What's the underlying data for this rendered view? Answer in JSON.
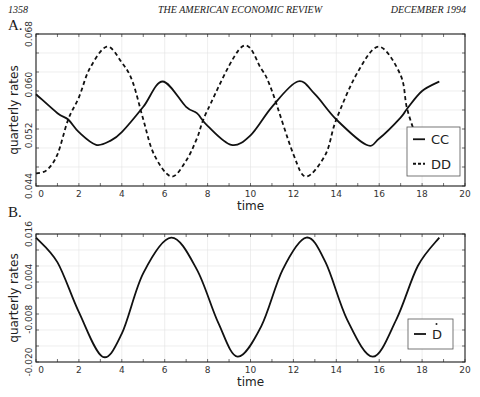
{
  "header": {
    "page_number": "1358",
    "journal": "THE AMERICAN ECONOMIC REVIEW",
    "date": "DECEMBER 1994"
  },
  "panels": {
    "a": {
      "label": "A."
    },
    "b": {
      "label": "B."
    }
  },
  "chart_data": [
    {
      "type": "line",
      "panel": "A.",
      "title": "",
      "xlabel": "time",
      "ylabel": "quarterly rates",
      "xlim": [
        0,
        20
      ],
      "ylim": [
        0.044,
        0.068
      ],
      "xticks": [
        "0",
        "2",
        "4",
        "6",
        "8",
        "10",
        "12",
        "14",
        "16",
        "18",
        "20"
      ],
      "yticks": [
        "0.044",
        "0.052",
        "0.060",
        "0.068"
      ],
      "grid": true,
      "legend_position": "lower right",
      "series": [
        {
          "name": "CC",
          "style": "solid",
          "x": [
            0,
            1,
            1.5,
            2,
            2.8,
            3.5,
            4,
            5,
            5.9,
            7,
            7.5,
            8,
            9.1,
            10,
            11,
            12.2,
            13,
            14,
            15.4,
            16,
            17,
            17.3,
            18,
            18.8
          ],
          "values": [
            0.0585,
            0.0555,
            0.0545,
            0.0525,
            0.0505,
            0.0512,
            0.0525,
            0.0565,
            0.0605,
            0.0565,
            0.0555,
            0.0535,
            0.0505,
            0.052,
            0.0565,
            0.0605,
            0.0585,
            0.0545,
            0.0505,
            0.0515,
            0.0548,
            0.0562,
            0.059,
            0.0605
          ]
        },
        {
          "name": "DD",
          "style": "dashed",
          "x": [
            0,
            0.5,
            1,
            1.5,
            2,
            2.5,
            3.3,
            4,
            4.5,
            5,
            5.5,
            6.3,
            7,
            7.5,
            8,
            9.6,
            10.5,
            11,
            12,
            12.6,
            13.5,
            14,
            15,
            16,
            17,
            17.3,
            17.8
          ],
          "values": [
            0.046,
            0.0465,
            0.049,
            0.0545,
            0.058,
            0.0625,
            0.066,
            0.0635,
            0.0605,
            0.0545,
            0.049,
            0.0455,
            0.048,
            0.0515,
            0.056,
            0.066,
            0.0625,
            0.059,
            0.049,
            0.0455,
            0.049,
            0.0545,
            0.062,
            0.066,
            0.0615,
            0.0562,
            0.051
          ]
        }
      ]
    },
    {
      "type": "line",
      "panel": "B.",
      "title": "",
      "xlabel": "time",
      "ylabel": "quarterly rates",
      "xlim": [
        0,
        20
      ],
      "ylim": [
        -0.02,
        0.016
      ],
      "xticks": [
        "0",
        "2",
        "4",
        "6",
        "8",
        "10",
        "12",
        "14",
        "16",
        "18",
        "20"
      ],
      "yticks": [
        "-0.020",
        "-0.008",
        "0.004",
        "0.016"
      ],
      "grid": true,
      "legend_position": "lower right",
      "series": [
        {
          "name": "Ḋ",
          "style": "solid",
          "x": [
            0,
            1,
            2,
            3.1,
            4,
            5,
            6.3,
            7.5,
            8.5,
            9.4,
            10.5,
            11.5,
            12.6,
            13.5,
            14.5,
            15.7,
            16.8,
            17.8,
            18.8
          ],
          "values": [
            0.015,
            0.008,
            -0.006,
            -0.0185,
            -0.012,
            0.005,
            0.015,
            0.006,
            -0.009,
            -0.0185,
            -0.01,
            0.006,
            0.015,
            0.008,
            -0.008,
            -0.0185,
            -0.008,
            0.007,
            0.015
          ]
        }
      ]
    }
  ],
  "legend_a": {
    "cc": "CC",
    "dd": "DD"
  },
  "legend_b": {
    "ddot": "D"
  },
  "axes": {
    "xlabel": "time",
    "ylabel": "quarterly rates"
  }
}
